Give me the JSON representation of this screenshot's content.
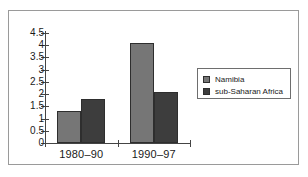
{
  "chart_data": {
    "type": "bar",
    "title": "",
    "subtitle": "",
    "xlabel": "",
    "ylabel": "",
    "categories": [
      "1980–90",
      "1990–97"
    ],
    "series": [
      {
        "name": "Namibia",
        "values": [
          1.3,
          4.1
        ],
        "color": "#767676"
      },
      {
        "name": "sub-Saharan Africa",
        "values": [
          1.8,
          2.1
        ],
        "color": "#3d3d3d"
      }
    ],
    "ylim": [
      0,
      4.5
    ],
    "yticks": [
      "0",
      "0.5",
      "1",
      "1.5",
      "2",
      "2.5",
      "3",
      "3.5",
      "4",
      "4.5"
    ],
    "ytick_values": [
      0,
      0.5,
      1,
      1.5,
      2,
      2.5,
      3,
      3.5,
      4,
      4.5
    ],
    "grid": false,
    "legend_position": "right",
    "axis_color": "#444444",
    "frame_color": "#9a9a9a",
    "background": "#ffffff"
  },
  "legend": {
    "entries": [
      {
        "label": "Namibia",
        "color": "#767676"
      },
      {
        "label": "sub-Saharan Africa",
        "color": "#3d3d3d"
      }
    ]
  }
}
